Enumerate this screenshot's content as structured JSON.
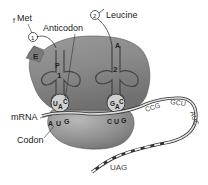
{
  "diagram": {
    "type": "translation-ribosome",
    "labels": {
      "fmet_prefix": "f",
      "fmet": "Met",
      "leucine": "Leucine",
      "anticodon": "Anticodon",
      "mrna": "mRNA",
      "codon": "Codon"
    },
    "amino_acid_markers": [
      {
        "id": "1",
        "glyph": "1"
      },
      {
        "id": "2",
        "glyph": "2"
      }
    ],
    "ribosome_sites": {
      "e": "E",
      "p": "P",
      "a": "A"
    },
    "trnas": [
      {
        "number": "1",
        "anticodon": [
          "U",
          "A",
          "C"
        ],
        "site": "P"
      },
      {
        "number": "2",
        "anticodon": [
          "G",
          "A",
          "C"
        ],
        "site": "A"
      }
    ],
    "mrna_codons": {
      "p_codon": [
        "A",
        "U",
        "G"
      ],
      "a_codon": [
        "C",
        "U",
        "G"
      ],
      "downstream": [
        "CCG",
        "GCU",
        "AUC"
      ],
      "stop": "UAG"
    },
    "colors": {
      "ribosome_light": "#c9c9c9",
      "ribosome_dark": "#6e6e6e",
      "outline": "#333333",
      "mrna_fill": "#d8d8d8",
      "background": "#ffffff"
    }
  }
}
